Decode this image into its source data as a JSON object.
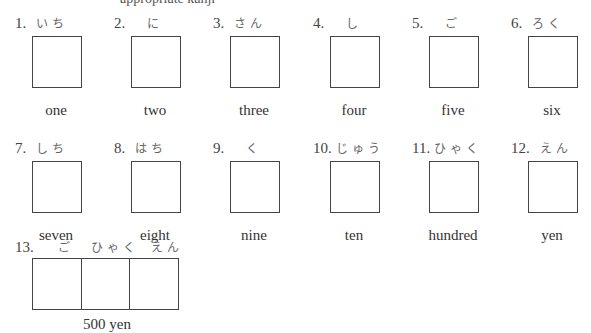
{
  "header": {
    "partial_instruction_text": "appropriate kanji"
  },
  "items": [
    {
      "number": "1.",
      "reading": "いち",
      "meaning": "one"
    },
    {
      "number": "2.",
      "reading": "に",
      "meaning": "two"
    },
    {
      "number": "3.",
      "reading": "さん",
      "meaning": "three"
    },
    {
      "number": "4.",
      "reading": "し",
      "meaning": "four"
    },
    {
      "number": "5.",
      "reading": "ご",
      "meaning": "five"
    },
    {
      "number": "6.",
      "reading": "ろく",
      "meaning": "six"
    },
    {
      "number": "7.",
      "reading": "しち",
      "meaning": "seven"
    },
    {
      "number": "8.",
      "reading": "はち",
      "meaning": "eight"
    },
    {
      "number": "9.",
      "reading": "く",
      "meaning": "nine"
    },
    {
      "number": "10.",
      "reading": "じゅう",
      "meaning": "ten"
    },
    {
      "number": "11.",
      "reading": "ひゃく",
      "meaning": "hundred"
    },
    {
      "number": "12.",
      "reading": "えん",
      "meaning": "yen"
    }
  ],
  "compound": {
    "number": "13.",
    "readings": [
      "ご",
      "ひゃく",
      "えん"
    ],
    "meaning": "500 yen"
  }
}
